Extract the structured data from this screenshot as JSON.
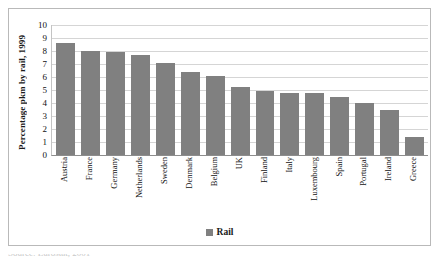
{
  "chart_data": {
    "type": "bar",
    "title": "",
    "xlabel": "",
    "ylabel": "Percentage pkm by rail, 1999",
    "ylim": [
      0,
      10
    ],
    "yticks": [
      10,
      9,
      8,
      7,
      6,
      5,
      4,
      3,
      2,
      1,
      0
    ],
    "grid": true,
    "legend_position": "bottom",
    "legend": [
      "Rail"
    ],
    "series_color": "#808080",
    "categories": [
      "Austria",
      "France",
      "Germany",
      "Netherlands",
      "Sweden",
      "Denmark",
      "Belgium",
      "UK",
      "Finland",
      "Italy",
      "Luxembourg",
      "Spain",
      "Portugal",
      "Ireland",
      "Greece"
    ],
    "series": [
      {
        "name": "Rail",
        "values": [
          8.6,
          8.0,
          7.9,
          7.7,
          7.1,
          6.4,
          6.1,
          5.2,
          4.95,
          4.75,
          4.75,
          4.5,
          4.0,
          3.5,
          1.4
        ]
      }
    ]
  },
  "legend": {
    "swatch_name": "rail-color-swatch",
    "label": "Rail"
  },
  "source_note": {
    "text": "Source: Eurostat, 2001"
  }
}
